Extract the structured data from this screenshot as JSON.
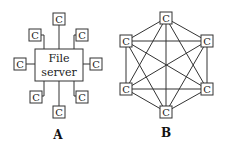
{
  "diagram_a": {
    "label": "A",
    "server": {
      "line1": "File",
      "line2": "server"
    },
    "client_label": "C",
    "clients": [
      {
        "name": "top",
        "text": "C"
      },
      {
        "name": "upper-left",
        "text": "C"
      },
      {
        "name": "upper-right",
        "text": "C"
      },
      {
        "name": "left",
        "text": "C"
      },
      {
        "name": "right",
        "text": "C"
      },
      {
        "name": "lower-left",
        "text": "C"
      },
      {
        "name": "lower-right",
        "text": "C"
      },
      {
        "name": "bottom",
        "text": "C"
      }
    ]
  },
  "diagram_b": {
    "label": "B",
    "clients": [
      {
        "name": "top",
        "text": "C"
      },
      {
        "name": "upper-left",
        "text": "C"
      },
      {
        "name": "upper-right",
        "text": "C"
      },
      {
        "name": "lower-left",
        "text": "C"
      },
      {
        "name": "lower-right",
        "text": "C"
      },
      {
        "name": "bottom",
        "text": "C"
      }
    ]
  }
}
